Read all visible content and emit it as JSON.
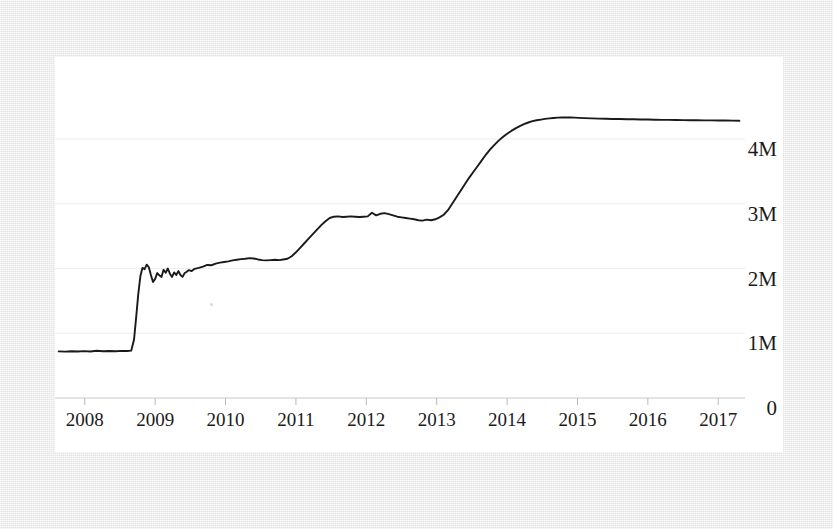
{
  "chart_data": {
    "type": "line",
    "title": "",
    "subtitle": "",
    "xlabel": "",
    "ylabel": "",
    "xlim": [
      2007.62,
      2017.38
    ],
    "ylim": [
      0,
      4600000
    ],
    "grid": true,
    "legend": false,
    "legend_position": "none",
    "line_color": "#1a1a1a",
    "gridline_color": "#ededed",
    "background_color": "#ffffff",
    "surround_color": "#e9e9e9",
    "y_ticks": [
      {
        "value": 0,
        "label": "0"
      },
      {
        "value": 1000000,
        "label": "1M"
      },
      {
        "value": 2000000,
        "label": "2M"
      },
      {
        "value": 3000000,
        "label": "3M"
      },
      {
        "value": 4000000,
        "label": "4M"
      }
    ],
    "x_ticks": [
      {
        "value": 2008,
        "label": "2008"
      },
      {
        "value": 2009,
        "label": "2009"
      },
      {
        "value": 2010,
        "label": "2010"
      },
      {
        "value": 2011,
        "label": "2011"
      },
      {
        "value": 2012,
        "label": "2012"
      },
      {
        "value": 2013,
        "label": "2013"
      },
      {
        "value": 2014,
        "label": "2014"
      },
      {
        "value": 2015,
        "label": "2015"
      },
      {
        "value": 2016,
        "label": "2016"
      },
      {
        "value": 2017,
        "label": "2017"
      }
    ],
    "series": [
      {
        "name": "value",
        "x": [
          2007.63,
          2007.72,
          2007.81,
          2007.9,
          2007.99,
          2008.08,
          2008.17,
          2008.26,
          2008.35,
          2008.44,
          2008.53,
          2008.6,
          2008.66,
          2008.7,
          2008.73,
          2008.76,
          2008.79,
          2008.82,
          2008.85,
          2008.88,
          2008.91,
          2008.94,
          2008.97,
          2009.0,
          2009.03,
          2009.06,
          2009.09,
          2009.12,
          2009.15,
          2009.18,
          2009.21,
          2009.24,
          2009.27,
          2009.3,
          2009.33,
          2009.36,
          2009.39,
          2009.42,
          2009.45,
          2009.48,
          2009.52,
          2009.56,
          2009.62,
          2009.68,
          2009.74,
          2009.8,
          2009.86,
          2009.92,
          2009.98,
          2010.04,
          2010.1,
          2010.16,
          2010.22,
          2010.28,
          2010.34,
          2010.4,
          2010.46,
          2010.52,
          2010.58,
          2010.64,
          2010.7,
          2010.76,
          2010.82,
          2010.88,
          2010.94,
          2011.0,
          2011.06,
          2011.12,
          2011.18,
          2011.24,
          2011.3,
          2011.36,
          2011.42,
          2011.48,
          2011.54,
          2011.6,
          2011.66,
          2011.72,
          2011.78,
          2011.84,
          2011.9,
          2011.96,
          2012.02,
          2012.08,
          2012.14,
          2012.2,
          2012.26,
          2012.32,
          2012.38,
          2012.44,
          2012.5,
          2012.56,
          2012.62,
          2012.68,
          2012.74,
          2012.8,
          2012.86,
          2012.92,
          2012.98,
          2013.04,
          2013.1,
          2013.16,
          2013.22,
          2013.28,
          2013.34,
          2013.4,
          2013.46,
          2013.52,
          2013.58,
          2013.64,
          2013.7,
          2013.76,
          2013.82,
          2013.88,
          2013.94,
          2014.0,
          2014.06,
          2014.12,
          2014.18,
          2014.24,
          2014.3,
          2014.36,
          2014.42,
          2014.48,
          2014.54,
          2014.6,
          2014.66,
          2014.72,
          2014.78,
          2014.84,
          2014.9,
          2014.96,
          2015.02,
          2015.1,
          2015.2,
          2015.3,
          2015.4,
          2015.5,
          2015.6,
          2015.7,
          2015.8,
          2015.9,
          2016.0,
          2016.1,
          2016.2,
          2016.3,
          2016.4,
          2016.5,
          2016.6,
          2016.7,
          2016.8,
          2016.9,
          2017.0,
          2017.1,
          2017.2,
          2017.3
        ],
        "y": [
          720000,
          716000,
          722000,
          718000,
          724000,
          719000,
          730000,
          723000,
          726000,
          721000,
          728000,
          726000,
          731000,
          900000,
          1240000,
          1600000,
          1880000,
          2010000,
          1990000,
          2060000,
          2020000,
          1900000,
          1790000,
          1840000,
          1930000,
          1895000,
          1870000,
          1980000,
          1935000,
          2000000,
          1920000,
          1870000,
          1940000,
          1900000,
          1960000,
          1900000,
          1870000,
          1930000,
          1950000,
          1975000,
          1960000,
          1995000,
          2010000,
          2030000,
          2055000,
          2050000,
          2075000,
          2090000,
          2100000,
          2110000,
          2125000,
          2135000,
          2145000,
          2150000,
          2160000,
          2155000,
          2140000,
          2130000,
          2125000,
          2130000,
          2135000,
          2130000,
          2140000,
          2150000,
          2190000,
          2250000,
          2320000,
          2390000,
          2460000,
          2530000,
          2600000,
          2670000,
          2730000,
          2780000,
          2800000,
          2805000,
          2795000,
          2800000,
          2805000,
          2800000,
          2795000,
          2800000,
          2805000,
          2860000,
          2820000,
          2845000,
          2855000,
          2840000,
          2820000,
          2800000,
          2790000,
          2780000,
          2770000,
          2760000,
          2745000,
          2740000,
          2755000,
          2745000,
          2760000,
          2790000,
          2830000,
          2900000,
          3000000,
          3100000,
          3200000,
          3300000,
          3400000,
          3490000,
          3580000,
          3670000,
          3760000,
          3840000,
          3910000,
          3975000,
          4030000,
          4080000,
          4125000,
          4165000,
          4200000,
          4230000,
          4255000,
          4275000,
          4290000,
          4300000,
          4310000,
          4318000,
          4325000,
          4330000,
          4332000,
          4334000,
          4333000,
          4330000,
          4326000,
          4322000,
          4318000,
          4315000,
          4312000,
          4310000,
          4308000,
          4306000,
          4304000,
          4302000,
          4300000,
          4298000,
          4296000,
          4295000,
          4293000,
          4292000,
          4290000,
          4289000,
          4288000,
          4287000,
          4286000,
          4285000,
          4284000,
          4283000
        ]
      }
    ]
  }
}
